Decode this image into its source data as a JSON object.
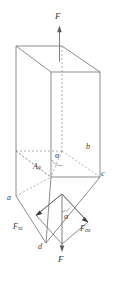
{
  "figure": {
    "colors": {
      "line": "#6e6e6e",
      "hidden_line": "#9a9a9a",
      "force_line": "#555555",
      "label": "#3a3a3a",
      "background": "#ffffff"
    },
    "labels": {
      "applied_force_top": "F",
      "applied_force_bottom": "F",
      "vertex_a": "a",
      "vertex_b": "b",
      "vertex_c": "c",
      "vertex_d": "d",
      "area_label": "A",
      "area_subscript": "0",
      "angle_plane": "α",
      "angle_force": "α",
      "shear_force": "F",
      "shear_force_subscript": "τα",
      "normal_force": "F",
      "normal_force_subscript": "σα"
    },
    "edge_text": {
      "top": "",
      "bottom": ""
    },
    "icons": {
      "arrow_up": "arrow-up-icon",
      "arrow_down": "arrow-down-icon",
      "arrow_shear": "arrow-down-left-icon",
      "arrow_normal": "arrow-down-right-icon"
    }
  }
}
